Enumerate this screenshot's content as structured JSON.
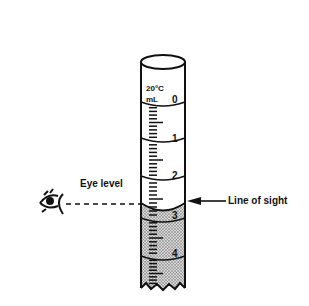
{
  "diagram": {
    "cylinder": {
      "temperature_label": "20°C",
      "unit_label": "mL",
      "scale_numbers": [
        "0",
        "1",
        "2",
        "3",
        "4"
      ],
      "liquid_top_value": 2.55,
      "meniscus_reading": 2.6
    },
    "labels": {
      "eye_level": "Eye level",
      "line_of_sight": "Line of sight"
    },
    "icons": {
      "eye": "eye-icon",
      "arrow": "arrow-left-icon"
    },
    "colors": {
      "ink": "#111111",
      "liquid_fill": "#bdbdbd",
      "background": "#ffffff"
    }
  }
}
